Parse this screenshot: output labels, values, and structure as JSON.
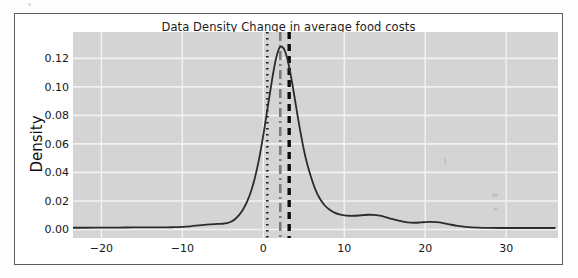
{
  "figure": {
    "title": "Data Density Change in average food costs",
    "background_color": "#ffffff",
    "frame_color": "#5c5c5c",
    "plot_background_color": "#d4d4d4",
    "grid_color": "#f2f2f2",
    "curve_color": "#2b2b2b"
  },
  "chart_data": {
    "type": "line",
    "title": "Data Density Change in average food costs",
    "xlabel": "",
    "ylabel": "Density",
    "xlim": [
      -23.5,
      36.4
    ],
    "ylim": [
      -0.006,
      0.1385
    ],
    "xticks": [
      -20,
      -10,
      0,
      10,
      20,
      30
    ],
    "xticklabels": [
      "−20",
      "−10",
      "0",
      "10",
      "20",
      "30"
    ],
    "yticks": [
      0.0,
      0.02,
      0.04,
      0.06,
      0.08,
      0.1,
      0.12
    ],
    "yticklabels": [
      "0.00",
      "0.02",
      "0.04",
      "0.06",
      "0.08",
      "0.10",
      "0.12"
    ],
    "grid": true,
    "legend": null,
    "series": [
      {
        "name": "Density",
        "style": "solid",
        "color": "#2b2b2b",
        "linewidth": 1.8,
        "x": [
          -23.5,
          -22.0,
          -20.0,
          -18.0,
          -16.0,
          -14.0,
          -12.0,
          -11.0,
          -10.0,
          -9.0,
          -8.0,
          -7.0,
          -6.0,
          -5.5,
          -5.0,
          -4.5,
          -4.0,
          -3.5,
          -3.0,
          -2.5,
          -2.0,
          -1.5,
          -1.0,
          -0.5,
          0.0,
          0.5,
          1.0,
          1.3,
          1.6,
          1.9,
          2.1,
          2.4,
          2.7,
          3.0,
          3.4,
          3.8,
          4.2,
          4.7,
          5.2,
          5.8,
          6.4,
          7.0,
          7.6,
          8.2,
          8.8,
          9.4,
          10.0,
          10.6,
          11.2,
          11.8,
          12.4,
          13.0,
          13.6,
          14.2,
          15.0,
          16.0,
          17.0,
          17.8,
          18.6,
          19.4,
          20.0,
          20.6,
          21.4,
          22.2,
          23.0,
          24.0,
          25.0,
          26.5,
          28.0,
          30.0,
          32.0,
          34.0,
          36.0
        ],
        "y": [
          0.0012,
          0.0012,
          0.0013,
          0.0013,
          0.0014,
          0.0014,
          0.0015,
          0.0016,
          0.0018,
          0.0022,
          0.0028,
          0.0034,
          0.0038,
          0.0039,
          0.004,
          0.0044,
          0.0054,
          0.0072,
          0.01,
          0.014,
          0.0195,
          0.027,
          0.037,
          0.05,
          0.066,
          0.084,
          0.102,
          0.112,
          0.1205,
          0.1262,
          0.1281,
          0.1278,
          0.1248,
          0.119,
          0.108,
          0.095,
          0.081,
          0.065,
          0.051,
          0.0385,
          0.0285,
          0.0215,
          0.0168,
          0.0138,
          0.0118,
          0.0106,
          0.0099,
          0.0096,
          0.0096,
          0.0098,
          0.0101,
          0.0103,
          0.0102,
          0.0098,
          0.0088,
          0.0072,
          0.0058,
          0.005,
          0.0047,
          0.0049,
          0.0052,
          0.0053,
          0.0051,
          0.0045,
          0.0036,
          0.0025,
          0.0018,
          0.0013,
          0.0011,
          0.001,
          0.001,
          0.001,
          0.001
        ]
      }
    ],
    "vlines": [
      {
        "name": "dotted-marker-line",
        "x": 0.5,
        "style": "dotted",
        "color": "#1e1e1e",
        "linewidth": 2.6
      },
      {
        "name": "dashdot-marker-line",
        "x": 2.1,
        "style": "dashdot",
        "color": "#7a7a7a",
        "linewidth": 2.6
      },
      {
        "name": "dashed-marker-line",
        "x": 3.2,
        "style": "dashed",
        "color": "#0d0d0d",
        "linewidth": 3.4
      }
    ]
  }
}
